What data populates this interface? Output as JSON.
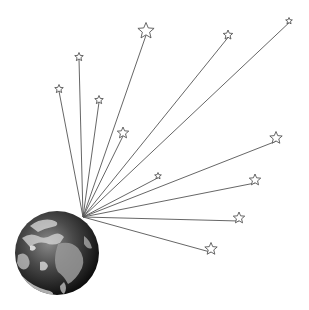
{
  "diagram": {
    "title": "",
    "background": "#ffffff",
    "line_color": "#555555",
    "star_stroke": "#555555",
    "origin": {
      "x": 83,
      "y": 217
    },
    "earth": {
      "cx": 57,
      "cy": 253,
      "r": 42,
      "label": ""
    },
    "stars": [
      {
        "x": 59,
        "y": 89,
        "size": 4.5
      },
      {
        "x": 79,
        "y": 57,
        "size": 4.5
      },
      {
        "x": 99,
        "y": 100,
        "size": 4.5
      },
      {
        "x": 146,
        "y": 31,
        "size": 8.5
      },
      {
        "x": 123,
        "y": 133,
        "size": 6
      },
      {
        "x": 228,
        "y": 35,
        "size": 5
      },
      {
        "x": 289,
        "y": 21,
        "size": 3.5
      },
      {
        "x": 158,
        "y": 176,
        "size": 3.5
      },
      {
        "x": 276,
        "y": 138,
        "size": 6.5
      },
      {
        "x": 255,
        "y": 180,
        "size": 6
      },
      {
        "x": 239,
        "y": 218,
        "size": 6
      },
      {
        "x": 211,
        "y": 249,
        "size": 6.5
      }
    ]
  }
}
